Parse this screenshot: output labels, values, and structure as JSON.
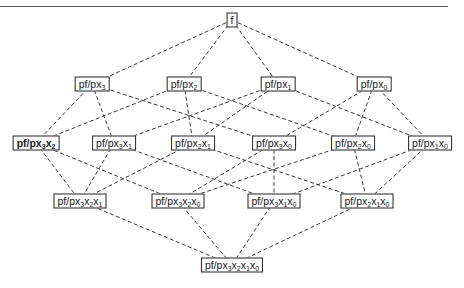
{
  "diagram": {
    "type": "lattice",
    "nodes": [
      {
        "id": "f",
        "label": "f",
        "subs": [],
        "x": 232,
        "y": 20,
        "bold": false
      },
      {
        "id": "px3",
        "label": "pf/px",
        "subs": [
          "3"
        ],
        "x": 92,
        "y": 84,
        "bold": false
      },
      {
        "id": "px2",
        "label": "pf/px",
        "subs": [
          "2"
        ],
        "x": 184,
        "y": 84,
        "bold": false
      },
      {
        "id": "px1",
        "label": "pf/px",
        "subs": [
          "1"
        ],
        "x": 278,
        "y": 84,
        "bold": false
      },
      {
        "id": "px0",
        "label": "pf/px",
        "subs": [
          "0"
        ],
        "x": 374,
        "y": 84,
        "bold": false
      },
      {
        "id": "px3x2",
        "label": "pf/px",
        "subs": [
          "3",
          "2"
        ],
        "x": 36,
        "y": 143,
        "bold": true
      },
      {
        "id": "px3x1",
        "label": "pf/px",
        "subs": [
          "3",
          "1"
        ],
        "x": 114,
        "y": 143,
        "bold": false
      },
      {
        "id": "px2x1",
        "label": "pf/px",
        "subs": [
          "2",
          "1"
        ],
        "x": 193,
        "y": 143,
        "bold": false
      },
      {
        "id": "px3x0",
        "label": "pf/px",
        "subs": [
          "3",
          "0"
        ],
        "x": 274,
        "y": 143,
        "bold": false
      },
      {
        "id": "px2x0",
        "label": "pf/px",
        "subs": [
          "2",
          "0"
        ],
        "x": 353,
        "y": 143,
        "bold": false
      },
      {
        "id": "px1x0",
        "label": "pf/px",
        "subs": [
          "1",
          "0"
        ],
        "x": 430,
        "y": 143,
        "bold": false
      },
      {
        "id": "px3x2x1",
        "label": "pf/px",
        "subs": [
          "3",
          "2",
          "1"
        ],
        "x": 80,
        "y": 201,
        "bold": false
      },
      {
        "id": "px3x2x0",
        "label": "pf/px",
        "subs": [
          "3",
          "2",
          "0"
        ],
        "x": 178,
        "y": 201,
        "bold": false
      },
      {
        "id": "px3x1x0",
        "label": "pf/px",
        "subs": [
          "3",
          "1",
          "0"
        ],
        "x": 274,
        "y": 201,
        "bold": false
      },
      {
        "id": "px2x1x0",
        "label": "pf/px",
        "subs": [
          "2",
          "1",
          "0"
        ],
        "x": 367,
        "y": 201,
        "bold": false
      },
      {
        "id": "px3x2x1x0",
        "label": "pf/px",
        "subs": [
          "3",
          "2",
          "1",
          "0"
        ],
        "x": 232,
        "y": 265,
        "bold": false
      }
    ],
    "edges": [
      [
        "f",
        "px3"
      ],
      [
        "f",
        "px2"
      ],
      [
        "f",
        "px1"
      ],
      [
        "f",
        "px0"
      ],
      [
        "px3",
        "px3x2"
      ],
      [
        "px3",
        "px3x1"
      ],
      [
        "px3",
        "px3x0"
      ],
      [
        "px2",
        "px3x2"
      ],
      [
        "px2",
        "px2x1"
      ],
      [
        "px2",
        "px2x0"
      ],
      [
        "px1",
        "px3x1"
      ],
      [
        "px1",
        "px2x1"
      ],
      [
        "px1",
        "px1x0"
      ],
      [
        "px0",
        "px3x0"
      ],
      [
        "px0",
        "px2x0"
      ],
      [
        "px0",
        "px1x0"
      ],
      [
        "px3x2",
        "px3x2x1"
      ],
      [
        "px3x2",
        "px3x2x0"
      ],
      [
        "px3x1",
        "px3x2x1"
      ],
      [
        "px3x1",
        "px3x1x0"
      ],
      [
        "px2x1",
        "px3x2x1"
      ],
      [
        "px2x1",
        "px2x1x0"
      ],
      [
        "px3x0",
        "px3x2x0"
      ],
      [
        "px3x0",
        "px3x1x0"
      ],
      [
        "px2x0",
        "px3x2x0"
      ],
      [
        "px2x0",
        "px2x1x0"
      ],
      [
        "px1x0",
        "px3x1x0"
      ],
      [
        "px1x0",
        "px2x1x0"
      ],
      [
        "px3x2x1",
        "px3x2x1x0"
      ],
      [
        "px3x2x0",
        "px3x2x1x0"
      ],
      [
        "px3x1x0",
        "px3x2x1x0"
      ],
      [
        "px2x1x0",
        "px3x2x1x0"
      ]
    ],
    "subscript_prefix": "x",
    "line_color": "#222222",
    "line_style": "dashed"
  }
}
